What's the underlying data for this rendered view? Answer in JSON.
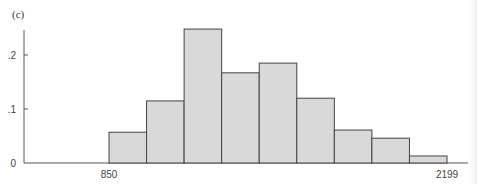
{
  "panel_label": "(c)",
  "chart_data": {
    "type": "bar",
    "title": "",
    "xlabel": "",
    "ylabel": "",
    "x_tick_labels": [
      "850",
      "2199"
    ],
    "y_tick_labels": [
      "0",
      ".1",
      ".2"
    ],
    "ylim": [
      0,
      0.25
    ],
    "bin_range": [
      850,
      2199
    ],
    "num_bins": 9,
    "values": [
      0.057,
      0.115,
      0.248,
      0.167,
      0.185,
      0.12,
      0.061,
      0.046,
      0.013
    ],
    "grid": false,
    "legend": null,
    "bar_color": "#d9d9d9",
    "edge_color": "#444444"
  }
}
